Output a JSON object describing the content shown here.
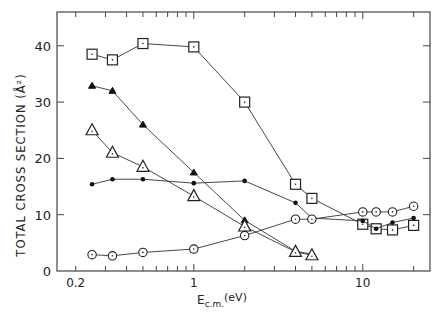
{
  "chart_data": {
    "type": "line",
    "title": "",
    "xlabel": "E_c.m.(eV)",
    "xlabel_main": "E",
    "xlabel_sub": "c.m.",
    "xlabel_unit": "(eV)",
    "ylabel": "TOTAL CROSS SECTION (Å²)",
    "xscale": "log",
    "xlim": [
      0.155,
      25
    ],
    "ylim": [
      0,
      46
    ],
    "x_ticks": [
      0.2,
      1,
      10
    ],
    "x_tick_labels": [
      "0.2",
      "1",
      "10"
    ],
    "y_ticks": [
      0,
      10,
      20,
      30,
      40
    ],
    "y_tick_labels": [
      "0",
      "10",
      "20",
      "30",
      "40"
    ],
    "grid": false,
    "legend": null,
    "series": [
      {
        "name": "open squares",
        "marker": "square-dot",
        "x": [
          0.25,
          0.33,
          0.5,
          1.0,
          2.0,
          4.0,
          5.0,
          10.0,
          12.0,
          15.0,
          20.0
        ],
        "y": [
          38.5,
          37.5,
          40.4,
          39.8,
          30.0,
          15.4,
          12.9,
          8.3,
          7.5,
          7.3,
          8.1
        ]
      },
      {
        "name": "filled triangles",
        "marker": "triangle-filled",
        "x": [
          0.25,
          0.33,
          0.5,
          1.0,
          2.0,
          4.0,
          5.0
        ],
        "y": [
          32.9,
          32.0,
          26.0,
          17.5,
          9.0,
          3.5,
          3.0
        ]
      },
      {
        "name": "open triangles",
        "marker": "triangle-open",
        "x": [
          0.25,
          0.33,
          0.5,
          1.0,
          2.0,
          4.0,
          5.0
        ],
        "y": [
          25.0,
          21.0,
          18.5,
          13.3,
          7.9,
          3.4,
          2.8
        ]
      },
      {
        "name": "filled dots",
        "marker": "dot",
        "x": [
          0.25,
          0.33,
          0.5,
          1.0,
          2.0,
          4.0,
          5.0,
          10.0,
          12.0,
          15.0,
          20.0
        ],
        "y": [
          15.4,
          16.3,
          16.3,
          15.6,
          16.0,
          12.1,
          9.4,
          8.9,
          7.5,
          8.6,
          9.4
        ]
      },
      {
        "name": "open circles",
        "marker": "circle-dot",
        "x": [
          0.25,
          0.33,
          0.5,
          1.0,
          2.0,
          4.0,
          5.0,
          10.0,
          12.0,
          15.0,
          20.0
        ],
        "y": [
          2.9,
          2.7,
          3.3,
          3.9,
          6.3,
          9.2,
          9.2,
          10.5,
          10.5,
          10.5,
          11.5
        ]
      }
    ]
  }
}
